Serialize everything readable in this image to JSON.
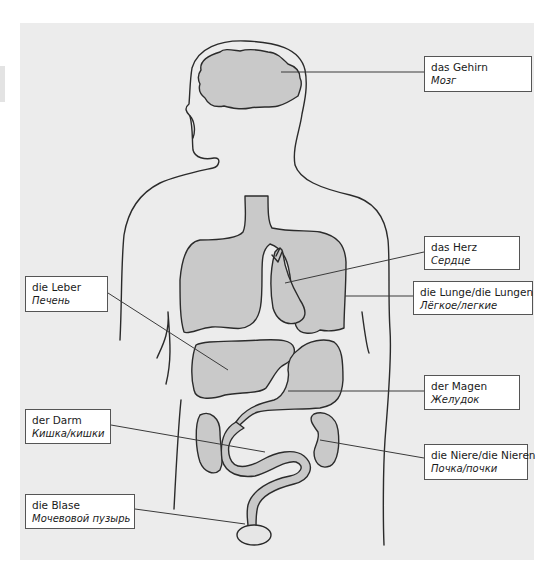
{
  "diagram": {
    "colors": {
      "panel_background": "#ececec",
      "organ_fill": "#c9c9c9",
      "bladder_fill": "#e6e6e6",
      "outline": "#2b2b2b",
      "label_background": "#ffffff",
      "label_border": "#555555"
    },
    "labels": [
      {
        "id": "brain",
        "german": "das Gehirn",
        "russian": "Мозг",
        "box": {
          "x": 424,
          "y": 56,
          "w": 108,
          "h": 36
        },
        "leader": {
          "x1": 281,
          "y1": 72,
          "x2": 424,
          "y2": 72
        }
      },
      {
        "id": "heart",
        "german": "das Herz",
        "russian": "Сердце",
        "box": {
          "x": 424,
          "y": 236,
          "w": 96,
          "h": 34
        },
        "leader": {
          "x1": 285,
          "y1": 283,
          "x2": 424,
          "y2": 252
        }
      },
      {
        "id": "lung",
        "german": "die Lunge/die Lungen",
        "russian": "Лёгкое/легкие",
        "box": {
          "x": 413,
          "y": 281,
          "w": 120,
          "h": 34
        },
        "leader": {
          "x1": 345,
          "y1": 296,
          "x2": 413,
          "y2": 296
        }
      },
      {
        "id": "liver",
        "german": "die Leber",
        "russian": "Печень",
        "box": {
          "x": 25,
          "y": 276,
          "w": 83,
          "h": 36
        },
        "leader": {
          "x1": 108,
          "y1": 293,
          "x2": 228,
          "y2": 370
        }
      },
      {
        "id": "stomach",
        "german": "der Magen",
        "russian": "Желудок",
        "box": {
          "x": 424,
          "y": 375,
          "w": 96,
          "h": 35
        },
        "leader": {
          "x1": 288,
          "y1": 391,
          "x2": 424,
          "y2": 391
        }
      },
      {
        "id": "kidney",
        "german": "die Niere/die Nieren",
        "russian": "Почка/почки",
        "box": {
          "x": 424,
          "y": 444,
          "w": 104,
          "h": 36
        },
        "leader": {
          "x1": 320,
          "y1": 440,
          "x2": 424,
          "y2": 458
        }
      },
      {
        "id": "intestine",
        "german": "der Darm",
        "russian": "Кишка/кишки",
        "box": {
          "x": 25,
          "y": 409,
          "w": 86,
          "h": 35
        },
        "leader": {
          "x1": 111,
          "y1": 425,
          "x2": 265,
          "y2": 452
        }
      },
      {
        "id": "bladder",
        "german": "die Blase",
        "russian": "Мочевовой пузырь",
        "box": {
          "x": 25,
          "y": 494,
          "w": 110,
          "h": 35
        },
        "leader": {
          "x1": 135,
          "y1": 509,
          "x2": 245,
          "y2": 524
        }
      }
    ]
  }
}
